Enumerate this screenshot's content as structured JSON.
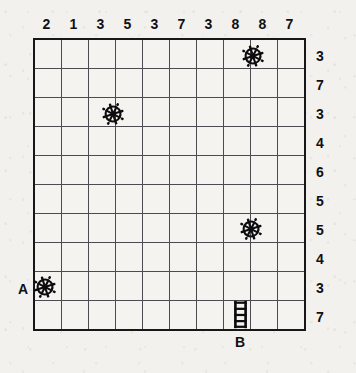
{
  "puzzle": {
    "title": "grid-puzzle",
    "grid": {
      "columns": 10,
      "rows": 10
    },
    "column_clues": [
      2,
      1,
      3,
      5,
      3,
      7,
      3,
      8,
      8,
      7
    ],
    "row_clues": [
      3,
      7,
      3,
      4,
      6,
      5,
      5,
      4,
      3,
      7
    ],
    "markers": [
      {
        "id": "wheel-1",
        "icon": "ships-wheel-icon",
        "label": "",
        "col": 8,
        "row": 1,
        "anchor": "bottom-right-corner"
      },
      {
        "id": "wheel-2",
        "icon": "ships-wheel-icon",
        "label": "",
        "col": 3,
        "row": 3,
        "anchor": "bottom-right-corner"
      },
      {
        "id": "wheel-3",
        "icon": "ships-wheel-icon",
        "label": "",
        "col": 8,
        "row": 7,
        "anchor": "bottom-right-corner"
      },
      {
        "id": "wheel-4",
        "icon": "ships-wheel-icon",
        "label": "A",
        "col": 1,
        "row": 9,
        "anchor": "bottom-left-corner"
      },
      {
        "id": "ladder-1",
        "icon": "ladder-icon",
        "label": "B",
        "col": 8,
        "row": 10,
        "anchor": "cell-center"
      }
    ],
    "point_labels": [
      {
        "text": "A",
        "for": "wheel-4"
      },
      {
        "text": "B",
        "for": "ladder-1"
      }
    ],
    "colors": {
      "paper": "#f2f1ee",
      "cell": "#f4f3f0",
      "border": "#17171a",
      "gridline": "#4b4b50",
      "ink": "#101014"
    }
  }
}
